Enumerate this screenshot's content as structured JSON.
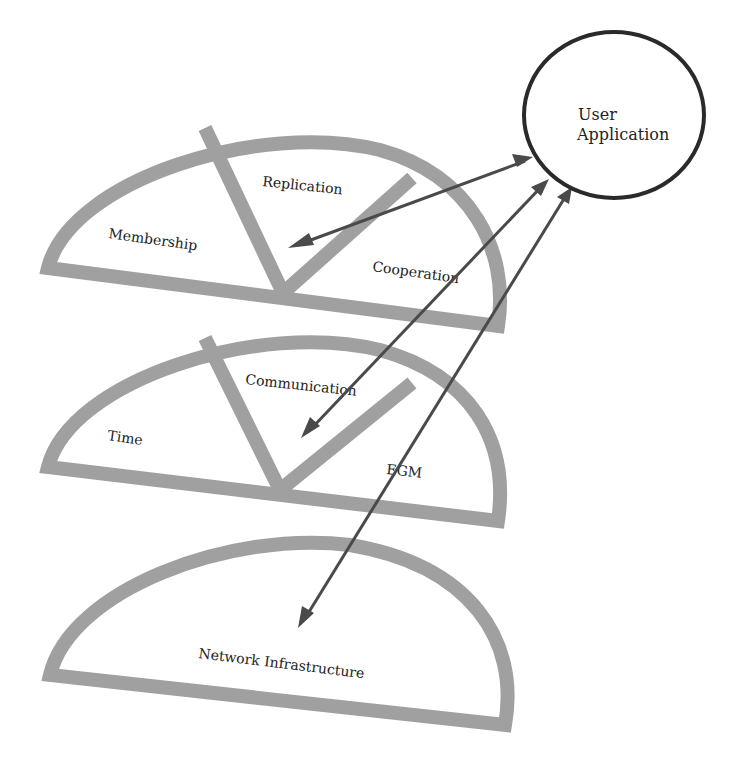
{
  "diagram": {
    "colors": {
      "layer_stroke": "#a0a0a0",
      "arrow": "#4a4a4a",
      "circle_stroke": "#2a2a2a",
      "background": "#ffffff"
    },
    "user_application": {
      "line1": "User",
      "line2": "Application"
    },
    "layers": [
      {
        "name": "top-layer",
        "sections": [
          "Membership",
          "Replication",
          "Cooperation"
        ]
      },
      {
        "name": "middle-layer",
        "sections": [
          "Time",
          "Communication",
          "EGM"
        ]
      },
      {
        "name": "bottom-layer",
        "sections": [
          "Network Infrastructure"
        ]
      }
    ],
    "arrows": [
      {
        "from": "User Application",
        "to": "Replication/Membership area (top layer)",
        "bidirectional": true
      },
      {
        "from": "User Application",
        "to": "Communication (middle layer)",
        "bidirectional": true
      },
      {
        "from": "User Application",
        "to": "Network Infrastructure (bottom layer)",
        "bidirectional": true
      }
    ]
  }
}
